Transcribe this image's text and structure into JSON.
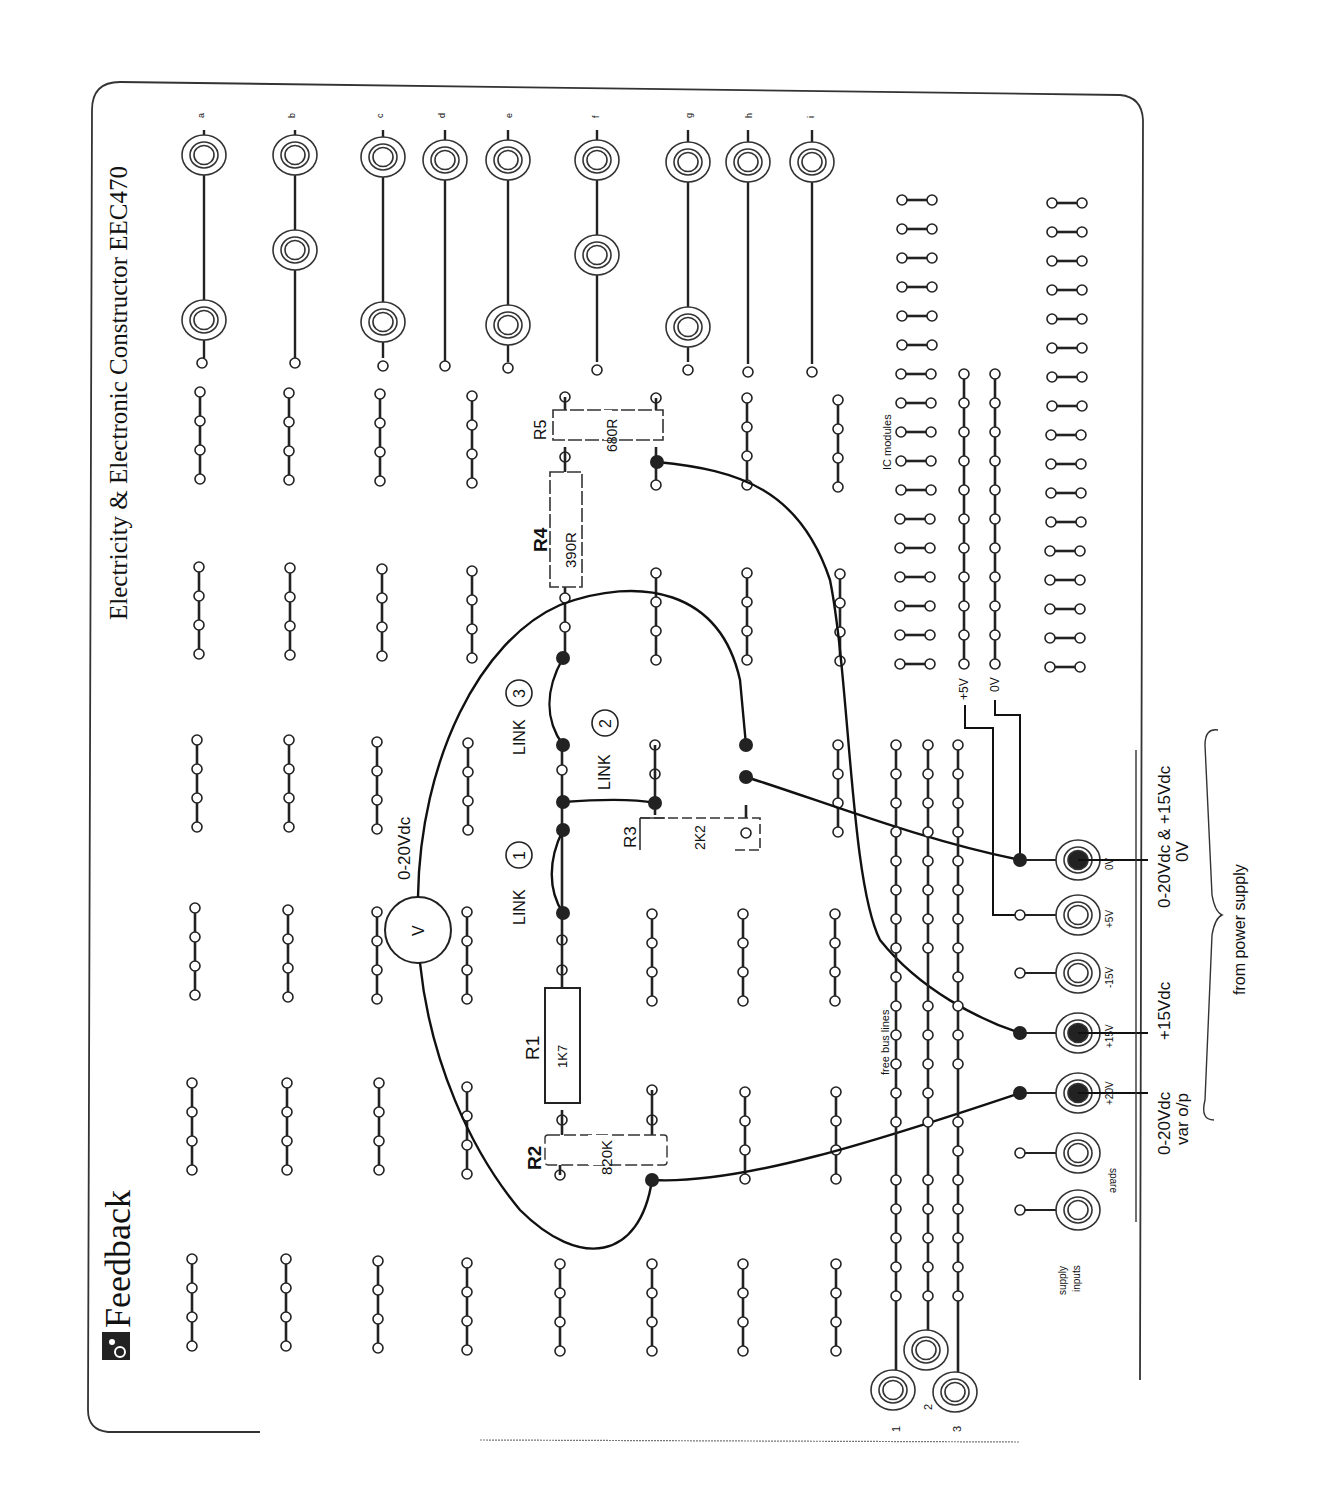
{
  "board": {
    "title": "Electricity & Electronic Constructor EEC470",
    "brand": "Feedback",
    "brand_logo_icon": "feedback-logo-icon"
  },
  "socket_rails": {
    "labels": [
      "a",
      "b",
      "c",
      "d",
      "e",
      "f",
      "g",
      "h",
      "i"
    ]
  },
  "components": {
    "R1": {
      "name": "R1",
      "value": "1K7"
    },
    "R2": {
      "name": "R2",
      "value": "820K"
    },
    "R3": {
      "name": "R3",
      "value": "2K2"
    },
    "R4": {
      "name": "R4",
      "value": "390R"
    },
    "R5": {
      "name": "R5",
      "value": "680R"
    },
    "voltmeter": {
      "symbol": "V",
      "label": "0-20Vdc"
    }
  },
  "links": [
    {
      "label": "LINK",
      "number": "1"
    },
    {
      "label": "LINK",
      "number": "2"
    },
    {
      "label": "LINK",
      "number": "3"
    }
  ],
  "ic_area": {
    "label": "IC modules",
    "plus5_label": "+5V",
    "zero_label": "0V"
  },
  "bus": {
    "label": "free bus lines",
    "numbers": [
      "1",
      "2",
      "3"
    ]
  },
  "supply": {
    "label_line1": "supply",
    "label_line2": "inputs",
    "sockets": [
      "spare",
      "+20V",
      "+15V",
      "-15V",
      "+5V",
      "0V"
    ],
    "annot_var_line1": "0-20Vdc",
    "annot_var_line2": "var o/p",
    "annot_15": "+15Vdc",
    "annot_common_line1": "0-20Vdc & +15Vdc",
    "annot_common_line2": "0V",
    "brace_label": "from power supply"
  },
  "colors": {
    "ink": "#111111",
    "paper": "#ffffff",
    "border": "#333333"
  }
}
